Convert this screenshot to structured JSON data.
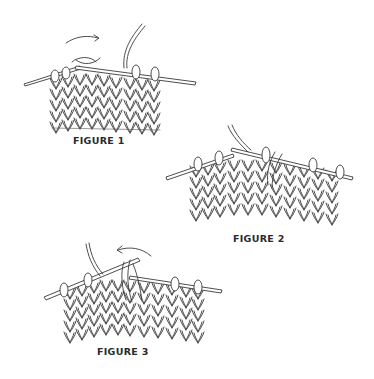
{
  "figures": [
    {
      "id": 1,
      "label": "FIGURE 1",
      "arrow_direction": "right"
    },
    {
      "id": 2,
      "label": "FIGURE 2",
      "arrow_direction": "none"
    },
    {
      "id": 3,
      "label": "FIGURE 3",
      "arrow_direction": "left"
    }
  ],
  "colors": {
    "background": "#ffffff",
    "ink": "#3a3a3a"
  }
}
